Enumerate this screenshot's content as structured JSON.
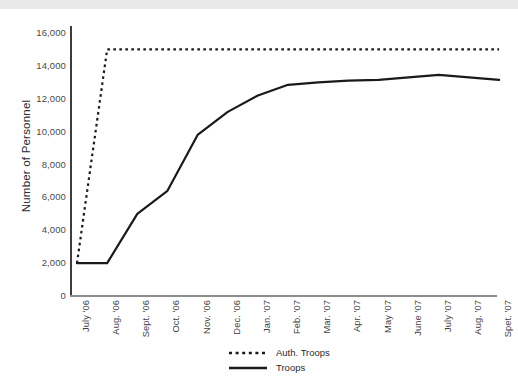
{
  "chart_data": {
    "type": "line",
    "title": "",
    "xlabel": "",
    "ylabel": "Number of Personnel",
    "ylim": [
      0,
      16000
    ],
    "ytick_labels": [
      "16,000",
      "14,000",
      "12,000",
      "10,000",
      "8,000",
      "6,000",
      "4,000",
      "2,000",
      "0"
    ],
    "ytick_values": [
      16000,
      14000,
      12000,
      10000,
      8000,
      6000,
      4000,
      2000,
      0
    ],
    "grid": false,
    "legend_position": "bottom-center",
    "categories": [
      "July '06",
      "Aug. '06",
      "Sept. '06",
      "Oct. '06",
      "Nov. '06",
      "Dec. '06",
      "Jan. '07",
      "Feb. '07",
      "Mar. '07",
      "Apr. '07",
      "May '07",
      "June '07",
      "July '07",
      "Aug. '07",
      "Spet. '07"
    ],
    "series": [
      {
        "name": "Auth. Troops",
        "style": "dotted",
        "color": "#1a1a1a",
        "values": [
          2000,
          15000,
          15000,
          15000,
          15000,
          15000,
          15000,
          15000,
          15000,
          15000,
          15000,
          15000,
          15000,
          15000,
          15000
        ]
      },
      {
        "name": "Troops",
        "style": "solid",
        "color": "#1a1a1a",
        "values": [
          2000,
          2000,
          5000,
          6400,
          9800,
          11200,
          12200,
          12850,
          13000,
          13100,
          13150,
          13300,
          13450,
          13300,
          13150
        ]
      }
    ]
  },
  "legend": {
    "items": [
      {
        "label": "Auth. Troops",
        "style": "dotted"
      },
      {
        "label": "Troops",
        "style": "solid"
      }
    ]
  }
}
